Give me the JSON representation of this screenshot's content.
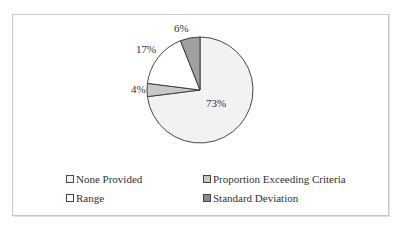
{
  "chart_data": {
    "type": "pie",
    "title": "",
    "categories": [
      "None Provided",
      "Proportion Exceeding Criteria",
      "Range",
      "Standard Deviation"
    ],
    "values": [
      73,
      4,
      17,
      6
    ],
    "unit": "%",
    "data_labels": [
      "73%",
      "4%",
      "17%",
      "6%"
    ],
    "colors": [
      "#f2f2f2",
      "#c8c8c8",
      "#ffffff",
      "#a0a0a0"
    ],
    "start_angle": "12 o'clock",
    "direction": "clockwise",
    "legend_position": "bottom"
  },
  "labels": {
    "none_provided": "73%",
    "proportion": "4%",
    "range": "17%",
    "std_dev": "6%"
  },
  "legend": {
    "items": [
      {
        "label": "None Provided",
        "color": "#f2f2f2"
      },
      {
        "label": "Proportion Exceeding Criteria",
        "color": "#c8c8c8"
      },
      {
        "label": "Range",
        "color": "#ffffff"
      },
      {
        "label": "Standard Deviation",
        "color": "#8c8c8c"
      }
    ]
  }
}
